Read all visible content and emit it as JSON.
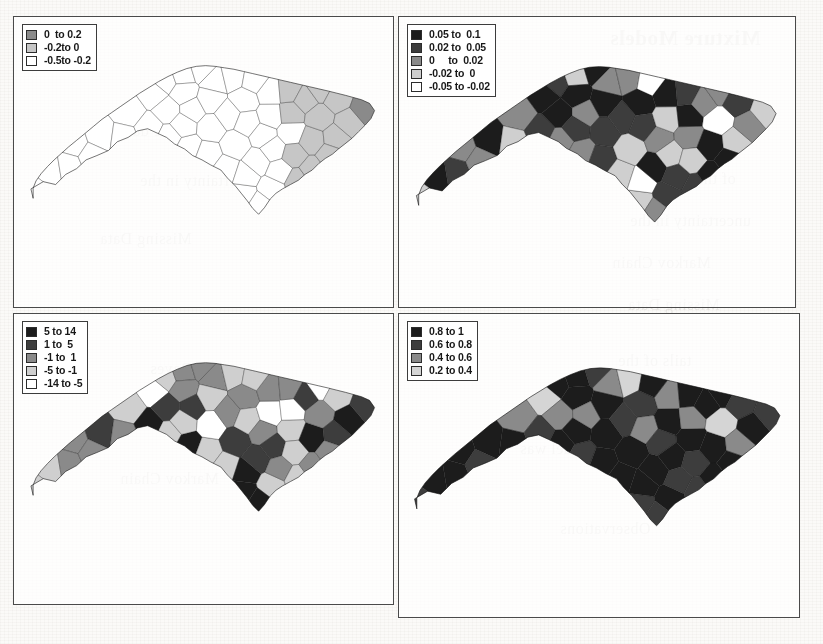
{
  "document": {
    "bleed_through_text": [
      "Mixture Models",
      "the data",
      "as a Bayes",
      "of the model was",
      "uncertainty in the",
      "Markov Chain",
      "Missing Data",
      "tails of the",
      "Observations"
    ]
  },
  "panels": [
    {
      "id": "top-left",
      "name": "panel-top-left",
      "legend": {
        "name": "legend-top-left",
        "entries": [
          {
            "label": "0  to 0.2",
            "color": "#8a8a8a"
          },
          {
            "label": "-0.2to 0",
            "color": "#c6c6c6"
          },
          {
            "label": "-0.5to -0.2",
            "color": "#ffffff"
          }
        ]
      },
      "map": {
        "name": "nc-county-choropleth",
        "region": "North Carolina counties",
        "class_colors": [
          "#8a8a8a",
          "#c6c6c6",
          "#ffffff"
        ]
      }
    },
    {
      "id": "top-right",
      "name": "panel-top-right",
      "legend": {
        "name": "legend-top-right",
        "entries": [
          {
            "label": "0.05 to  0.1",
            "color": "#1c1c1c"
          },
          {
            "label": "0.02 to  0.05",
            "color": "#3d3d3d"
          },
          {
            "label": "0     to  0.02",
            "color": "#8a8a8a"
          },
          {
            "label": "-0.02 to  0",
            "color": "#cfcfcf"
          },
          {
            "label": "-0.05 to -0.02",
            "color": "#ffffff"
          }
        ]
      },
      "map": {
        "name": "nc-county-choropleth",
        "region": "North Carolina counties",
        "class_colors": [
          "#1c1c1c",
          "#3d3d3d",
          "#8a8a8a",
          "#cfcfcf",
          "#ffffff"
        ]
      }
    },
    {
      "id": "bottom-left",
      "name": "panel-bottom-left",
      "legend": {
        "name": "legend-bottom-left",
        "entries": [
          {
            "label": "5 to 14",
            "color": "#1c1c1c"
          },
          {
            "label": "1 to  5",
            "color": "#3d3d3d"
          },
          {
            "label": "-1 to  1",
            "color": "#8a8a8a"
          },
          {
            "label": "-5 to -1",
            "color": "#cfcfcf"
          },
          {
            "label": "-14 to -5",
            "color": "#ffffff"
          }
        ]
      },
      "map": {
        "name": "nc-county-choropleth",
        "region": "North Carolina counties",
        "class_colors": [
          "#1c1c1c",
          "#3d3d3d",
          "#8a8a8a",
          "#cfcfcf",
          "#ffffff"
        ]
      }
    },
    {
      "id": "bottom-right",
      "name": "panel-bottom-right",
      "legend": {
        "name": "legend-bottom-right",
        "entries": [
          {
            "label": "0.8 to 1",
            "color": "#1c1c1c"
          },
          {
            "label": "0.6 to 0.8",
            "color": "#3d3d3d"
          },
          {
            "label": "0.4 to 0.6",
            "color": "#8a8a8a"
          },
          {
            "label": "0.2 to 0.4",
            "color": "#d5d5d5"
          }
        ]
      },
      "map": {
        "name": "nc-county-choropleth",
        "region": "North Carolina counties",
        "class_colors": [
          "#1c1c1c",
          "#3d3d3d",
          "#8a8a8a",
          "#d5d5d5"
        ]
      }
    }
  ],
  "chart_data": {
    "type": "heatmap",
    "subtype": "choropleth-map-grid",
    "title": "",
    "region": "North Carolina counties (100 counties)",
    "panel_count": 4,
    "grid": "2 x 2",
    "legend_position": "top-left of each panel",
    "panels": [
      {
        "id": "top-left",
        "n_classes": 3,
        "bins": [
          {
            "label": "0  to 0.2",
            "min": 0.0,
            "max": 0.2,
            "color": "#8a8a8a",
            "county_count": 43
          },
          {
            "label": "-0.2to 0",
            "min": -0.2,
            "max": 0.0,
            "color": "#c6c6c6",
            "county_count": 14
          },
          {
            "label": "-0.5to -0.2",
            "min": -0.5,
            "max": -0.2,
            "color": "#ffffff",
            "county_count": 43
          }
        ],
        "class_assignments": [
          2,
          2,
          2,
          2,
          2,
          2,
          2,
          2,
          2,
          2,
          2,
          2,
          2,
          2,
          2,
          2,
          2,
          2,
          2,
          2,
          2,
          2,
          2,
          2,
          2,
          2,
          2,
          2,
          2,
          2,
          2,
          2,
          2,
          2,
          2,
          2,
          2,
          2,
          2,
          2,
          2,
          1,
          1,
          1,
          1,
          1,
          1,
          1,
          1,
          1,
          1,
          1,
          1,
          1,
          0,
          0,
          0,
          0,
          0,
          0,
          0,
          0,
          0,
          0,
          0,
          0,
          0,
          0,
          0,
          0,
          0,
          0,
          0,
          0,
          0,
          0,
          0,
          0,
          0,
          0,
          0,
          0,
          0,
          0,
          0,
          0,
          0,
          0,
          0,
          0,
          0,
          0,
          0,
          0,
          1,
          1,
          1,
          0,
          0,
          2
        ]
      },
      {
        "id": "top-right",
        "n_classes": 5,
        "bins": [
          {
            "label": "0.05 to  0.1",
            "min": 0.05,
            "max": 0.1,
            "color": "#1c1c1c",
            "county_count": 24
          },
          {
            "label": "0.02 to  0.05",
            "min": 0.02,
            "max": 0.05,
            "color": "#3d3d3d",
            "county_count": 21
          },
          {
            "label": "0     to  0.02",
            "min": 0.0,
            "max": 0.02,
            "color": "#8a8a8a",
            "county_count": 24
          },
          {
            "label": "-0.02 to  0",
            "min": -0.02,
            "max": 0.0,
            "color": "#cfcfcf",
            "county_count": 21
          },
          {
            "label": "-0.05 to -0.02",
            "min": -0.05,
            "max": -0.02,
            "color": "#ffffff",
            "county_count": 10
          }
        ],
        "class_assignments": [
          0,
          2,
          3,
          1,
          2,
          0,
          2,
          1,
          3,
          0,
          1,
          2,
          3,
          0,
          2,
          1,
          0,
          3,
          2,
          1,
          0,
          3,
          1,
          2,
          0,
          1,
          3,
          2,
          0,
          4,
          1,
          0,
          2,
          3,
          1,
          0,
          2,
          4,
          3,
          1,
          2,
          0,
          1,
          3,
          2,
          0,
          4,
          1,
          2,
          3,
          0,
          1,
          2,
          0,
          3,
          1,
          4,
          2,
          0,
          3,
          1,
          2,
          0,
          3,
          1,
          0,
          2,
          4,
          3,
          1,
          0,
          2,
          1,
          3,
          0,
          2,
          1,
          0,
          3,
          4,
          2,
          1,
          0,
          3,
          2,
          4,
          1,
          0,
          2,
          3,
          1,
          2,
          0,
          4,
          3,
          1,
          2,
          0,
          3,
          2
        ]
      },
      {
        "id": "bottom-left",
        "n_classes": 5,
        "bins": [
          {
            "label": "5 to 14",
            "min": 5,
            "max": 14,
            "color": "#1c1c1c",
            "county_count": 21
          },
          {
            "label": "1 to  5",
            "min": 1,
            "max": 5,
            "color": "#3d3d3d",
            "county_count": 19
          },
          {
            "label": "-1 to  1",
            "min": -1,
            "max": 1,
            "color": "#8a8a8a",
            "county_count": 24
          },
          {
            "label": "-5 to -1",
            "min": -5,
            "max": -1,
            "color": "#cfcfcf",
            "county_count": 22
          },
          {
            "label": "-14 to -5",
            "min": -14,
            "max": -5,
            "color": "#ffffff",
            "county_count": 14
          }
        ],
        "class_assignments": [
          3,
          2,
          3,
          2,
          3,
          1,
          2,
          3,
          2,
          4,
          0,
          3,
          2,
          1,
          0,
          3,
          2,
          0,
          1,
          3,
          2,
          3,
          4,
          2,
          3,
          2,
          1,
          3,
          2,
          0,
          3,
          1,
          2,
          4,
          3,
          2,
          0,
          3,
          1,
          2,
          3,
          4,
          2,
          3,
          1,
          0,
          2,
          3,
          4,
          1,
          2,
          3,
          0,
          2,
          1,
          3,
          4,
          2,
          0,
          3,
          1,
          2,
          3,
          0,
          2,
          4,
          1,
          3,
          2,
          0,
          3,
          1,
          2,
          3,
          4,
          0,
          2,
          1,
          3,
          2,
          0,
          3,
          1,
          2,
          4,
          3,
          0,
          2,
          1,
          3,
          2,
          0,
          3,
          1,
          2,
          4,
          3,
          0,
          1,
          2
        ]
      },
      {
        "id": "bottom-right",
        "n_classes": 4,
        "bins": [
          {
            "label": "0.8 to 1",
            "min": 0.8,
            "max": 1.0,
            "color": "#1c1c1c",
            "county_count": 38
          },
          {
            "label": "0.6 to 0.8",
            "min": 0.6,
            "max": 0.8,
            "color": "#3d3d3d",
            "county_count": 31
          },
          {
            "label": "0.4 to 0.6",
            "min": 0.4,
            "max": 0.6,
            "color": "#8a8a8a",
            "county_count": 20
          },
          {
            "label": "0.2 to 0.4",
            "min": 0.2,
            "max": 0.4,
            "color": "#d5d5d5",
            "county_count": 11
          }
        ],
        "class_assignments": [
          0,
          0,
          1,
          0,
          2,
          0,
          1,
          0,
          0,
          3,
          1,
          0,
          0,
          2,
          1,
          0,
          0,
          1,
          2,
          0,
          1,
          0,
          0,
          2,
          0,
          1,
          0,
          3,
          1,
          0,
          2,
          0,
          1,
          0,
          0,
          2,
          1,
          0,
          0,
          1,
          0,
          2,
          0,
          1,
          0,
          0,
          3,
          1,
          0,
          2,
          0,
          1,
          0,
          0,
          1,
          2,
          0,
          1,
          0,
          0,
          2,
          1,
          0,
          0,
          1,
          3,
          0,
          2,
          1,
          0,
          0,
          1,
          2,
          0,
          1,
          0,
          0,
          2,
          1,
          3,
          0,
          1,
          0,
          2,
          1,
          0,
          3,
          2,
          1,
          0,
          0,
          2,
          1,
          0,
          3,
          2,
          1,
          0,
          2,
          1
        ]
      }
    ]
  }
}
